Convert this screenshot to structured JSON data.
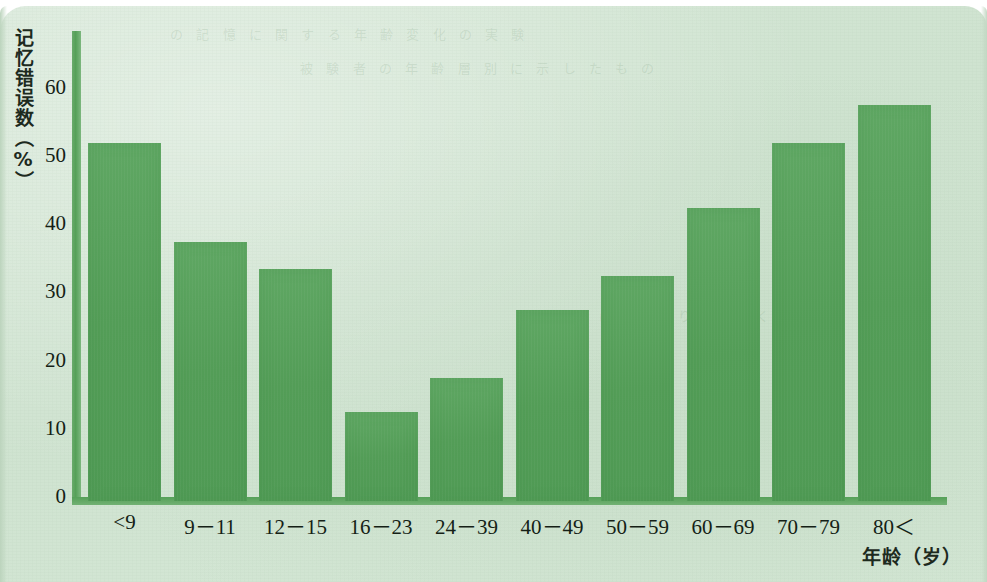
{
  "chart_data": {
    "type": "bar",
    "title": "",
    "xlabel": "年龄（岁）",
    "ylabel": "记忆错误数（%）",
    "categories": [
      "<9",
      "9－11",
      "12－15",
      "16－23",
      "24－39",
      "40－49",
      "50－59",
      "60－69",
      "70－79",
      "80＜"
    ],
    "values": [
      52.5,
      38,
      34,
      13,
      18,
      28,
      33,
      43,
      52.5,
      58
    ],
    "ylim": [
      0,
      68
    ],
    "yticks": [
      0,
      10,
      20,
      30,
      40,
      50,
      60
    ],
    "ytick_labels": [
      "0",
      "10",
      "20",
      "30",
      "40",
      "50",
      "60"
    ],
    "grid": false,
    "legend": null,
    "series": [
      {
        "name": "记忆错误数",
        "values": [
          52.5,
          38,
          34,
          13,
          18,
          28,
          33,
          43,
          52.5,
          58
        ]
      }
    ]
  },
  "style": {
    "bar_color": "#539d57",
    "axis_color": "#55a058",
    "paper_color": "#d3e5d4",
    "text_color": "#151f16"
  },
  "bleed_text": {
    "row1": "の 記 憶 に 関 す る 年 齢 変 化 の 実 験",
    "row2": "被 験 者 の 年 齢 層 別 に 示 し た も の",
    "row3": "高 齢 者 ほ ど 誤 り が 多 く な る"
  }
}
